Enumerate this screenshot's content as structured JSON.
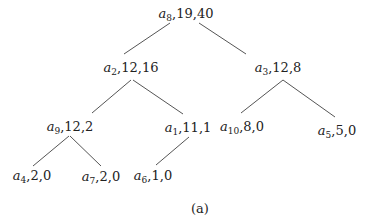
{
  "diagram": {
    "type": "tree",
    "nodes": [
      {
        "id": "a8",
        "var": "a",
        "sub": "8",
        "rest": ",19,40",
        "x": 186,
        "y": 6
      },
      {
        "id": "a2",
        "var": "a",
        "sub": "2",
        "rest": ",12,16",
        "x": 130,
        "y": 60
      },
      {
        "id": "a3",
        "var": "a",
        "sub": "3",
        "rest": ",12,8",
        "x": 276,
        "y": 60
      },
      {
        "id": "a9",
        "var": "a",
        "sub": "9",
        "rest": ",12,2",
        "x": 70,
        "y": 120
      },
      {
        "id": "a1",
        "var": "a",
        "sub": "1",
        "rest": ",11,1",
        "x": 185,
        "y": 120
      },
      {
        "id": "a10",
        "var": "a",
        "sub": "10",
        "rest": ",8,0",
        "x": 241,
        "y": 121
      },
      {
        "id": "a5",
        "var": "a",
        "sub": "5",
        "rest": ",5,0",
        "x": 339,
        "y": 124
      },
      {
        "id": "a4",
        "var": "a",
        "sub": "4",
        "rest": ",2,0",
        "x": 32,
        "y": 167
      },
      {
        "id": "a7",
        "var": "a",
        "sub": "7",
        "rest": ",2,0",
        "x": 101,
        "y": 167
      },
      {
        "id": "a6",
        "var": "a",
        "sub": "6",
        "rest": ",1,0",
        "x": 153,
        "y": 167
      }
    ],
    "edges": [
      {
        "from": "a8",
        "to": "a2",
        "x1": 170,
        "y1": 23,
        "x2": 124,
        "y2": 54
      },
      {
        "from": "a8",
        "to": "a3",
        "x1": 199,
        "y1": 23,
        "x2": 246,
        "y2": 54
      },
      {
        "from": "a2",
        "to": "a9",
        "x1": 133,
        "y1": 80,
        "x2": 92,
        "y2": 113
      },
      {
        "from": "a2",
        "to": "a1",
        "x1": 133,
        "y1": 80,
        "x2": 183,
        "y2": 114
      },
      {
        "from": "a3",
        "to": "a10",
        "x1": 283,
        "y1": 80,
        "x2": 241,
        "y2": 113
      },
      {
        "from": "a3",
        "to": "a5",
        "x1": 283,
        "y1": 80,
        "x2": 335,
        "y2": 117
      },
      {
        "from": "a9",
        "to": "a4",
        "x1": 70,
        "y1": 136,
        "x2": 33,
        "y2": 166
      },
      {
        "from": "a9",
        "to": "a7",
        "x1": 70,
        "y1": 136,
        "x2": 101,
        "y2": 166
      },
      {
        "from": "a1",
        "to": "a6",
        "x1": 189,
        "y1": 137,
        "x2": 156,
        "y2": 165
      }
    ],
    "caption": "(a)"
  },
  "labels": {
    "a8": {
      "v": "a",
      "s": "8",
      "r": ",19,40"
    },
    "a2": {
      "v": "a",
      "s": "2",
      "r": ",12,16"
    },
    "a3": {
      "v": "a",
      "s": "3",
      "r": ",12,8"
    },
    "a9": {
      "v": "a",
      "s": "9",
      "r": ",12,2"
    },
    "a1": {
      "v": "a",
      "s": "1",
      "r": ",11,1"
    },
    "a10": {
      "v": "a",
      "s": "10",
      "r": ",8,0"
    },
    "a5": {
      "v": "a",
      "s": "5",
      "r": ",5,0"
    },
    "a4": {
      "v": "a",
      "s": "4",
      "r": ",2,0"
    },
    "a7": {
      "v": "a",
      "s": "7",
      "r": ",2,0"
    },
    "a6": {
      "v": "a",
      "s": "6",
      "r": ",1,0"
    }
  }
}
